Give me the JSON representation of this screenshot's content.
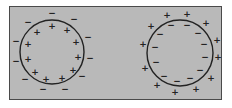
{
  "diagram": {
    "background_color": "#b9b9b9",
    "border_color": "#4a4a4a",
    "cells": [
      {
        "label": "left-cell",
        "center": [
          52,
          52
        ],
        "radius": 32,
        "inside_sign": "+",
        "outside_sign": "−",
        "inside_count": 12,
        "outside_count": 13
      },
      {
        "label": "right-cell",
        "center": [
          180,
          53
        ],
        "radius": 33,
        "inside_sign": "−",
        "outside_sign": "+",
        "inside_count": 14,
        "outside_count": 14
      }
    ]
  }
}
